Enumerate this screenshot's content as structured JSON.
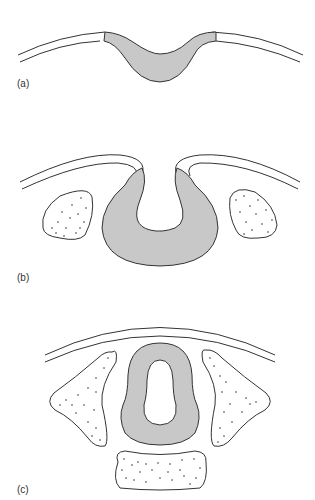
{
  "figure": {
    "panels": [
      {
        "id": "a",
        "label": "(a)",
        "stage": "neural plate / neural groove"
      },
      {
        "id": "b",
        "label": "(b)",
        "stage": "neural folds elevating"
      },
      {
        "id": "c",
        "label": "(c)",
        "stage": "closed neural tube"
      }
    ],
    "colors": {
      "neural_tissue_fill": "#c8c8c8",
      "outline": "#333333",
      "background": "#ffffff"
    }
  }
}
